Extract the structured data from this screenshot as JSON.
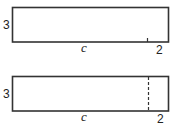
{
  "diagram": {
    "top_figure": {
      "height_label": "3",
      "length_label": "c",
      "extension_label": "2",
      "divider": "tick"
    },
    "bottom_figure": {
      "height_label": "3",
      "length_label": "c",
      "extension_label": "2",
      "divider": "dashed-line"
    },
    "colors": {
      "stroke": "#333333",
      "text": "#222222",
      "background": "#ffffff"
    }
  }
}
